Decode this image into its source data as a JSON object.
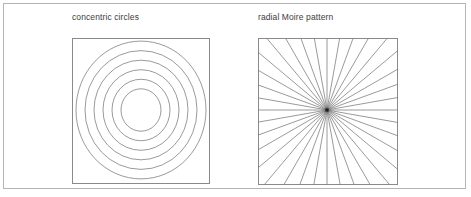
{
  "figure": {
    "width": 471,
    "height": 197,
    "background_color": "#ffffff",
    "frame_color": "#b4b4b4",
    "line_color": "#6e6e6e",
    "panel_border_color": "#8a8a8a",
    "text_color": "#3d3d3d"
  },
  "panels": [
    {
      "id": "concentric-circles",
      "caption": "concentric circles",
      "type": "concentric-circles",
      "frame": {
        "x": 72,
        "y": 38,
        "width": 138,
        "height": 146
      },
      "center": {
        "x": 69,
        "y": 72
      },
      "ring_count": 6,
      "radii": [
        20,
        29,
        38,
        47,
        56,
        65
      ]
    },
    {
      "id": "radial-moire",
      "caption": "radial Moire pattern",
      "type": "radial-lines",
      "frame": {
        "x": 258,
        "y": 38,
        "width": 140,
        "height": 147
      },
      "center": {
        "x": 69,
        "y": 72
      },
      "spoke_count": 18,
      "angle_step_degrees": 10,
      "center_dot_size": 3.2
    }
  ],
  "chart_data": {
    "type": "line",
    "title": "",
    "subtitle": "",
    "xlabel": "",
    "ylabel": "",
    "annotations": [
      "concentric circles",
      "radial Moire pattern"
    ],
    "series": [
      {
        "name": "concentric circles",
        "kind": "circles",
        "center": [
          69,
          72
        ],
        "radii": [
          20,
          29,
          38,
          47,
          56,
          65
        ],
        "count": 6
      },
      {
        "name": "radial Moire pattern",
        "kind": "spokes",
        "center": [
          69,
          72
        ],
        "count": 18,
        "angle_step_degrees": 10,
        "angles_degrees": [
          0,
          10,
          20,
          30,
          40,
          50,
          60,
          70,
          80,
          90,
          100,
          110,
          120,
          130,
          140,
          150,
          160,
          170
        ]
      }
    ]
  }
}
